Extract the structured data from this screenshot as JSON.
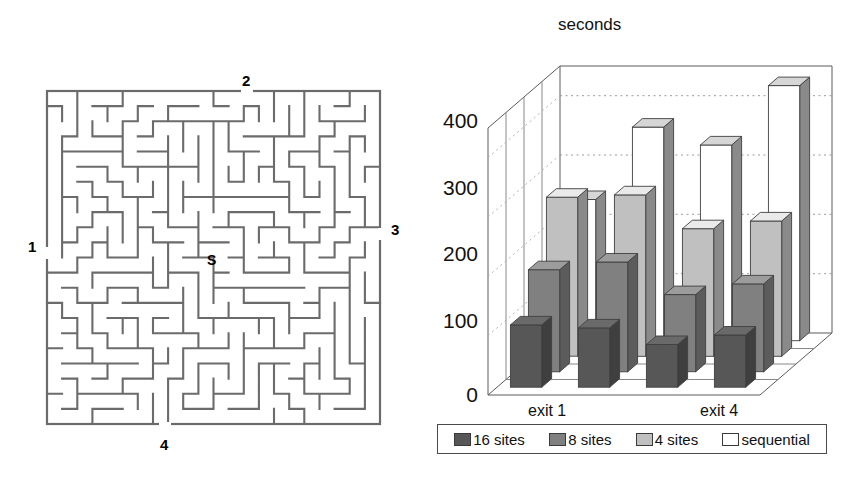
{
  "figure": {
    "maze": {
      "name": "maze-diagram",
      "start_marker": "S",
      "exit_labels": [
        {
          "id": "1",
          "position": "left"
        },
        {
          "id": "2",
          "position": "top"
        },
        {
          "id": "3",
          "position": "right"
        },
        {
          "id": "4",
          "position": "bottom"
        }
      ]
    }
  },
  "chart_data": {
    "type": "bar",
    "title": "seconds",
    "xlabel": "",
    "ylabel": "seconds",
    "ylim": [
      0,
      450
    ],
    "yticks": [
      0,
      100,
      200,
      300,
      400
    ],
    "ytick_labels": [
      "0",
      "100",
      "200",
      "300",
      "400"
    ],
    "grid": true,
    "projection": "3d",
    "legend_position": "bottom",
    "categories": [
      "exit 1",
      "exit 2",
      "exit 3",
      "exit 4"
    ],
    "visible_category_labels": [
      "exit 1",
      "exit 4"
    ],
    "series": [
      {
        "name": "16 sites",
        "color": "#575757",
        "values": [
          105,
          100,
          72,
          88
        ]
      },
      {
        "name": "8 sites",
        "color": "#808080",
        "values": [
          172,
          185,
          130,
          148
        ]
      },
      {
        "name": "4 sites",
        "color": "#c0c0c0",
        "values": [
          268,
          272,
          215,
          228
        ]
      },
      {
        "name": "sequential",
        "color": "#ffffff",
        "values": [
          238,
          360,
          330,
          430
        ]
      }
    ]
  },
  "legend": {
    "items": [
      {
        "label": "16 sites",
        "color": "#575757"
      },
      {
        "label": "8 sites",
        "color": "#808080"
      },
      {
        "label": "4 sites",
        "color": "#c0c0c0"
      },
      {
        "label": "sequential",
        "color": "#ffffff"
      }
    ]
  },
  "axis": {
    "tick_400": "400",
    "tick_300": "300",
    "tick_200": "200",
    "tick_100": "100",
    "tick_0": "0",
    "cat_first": "exit 1",
    "cat_last": "exit 4",
    "title": "seconds"
  }
}
